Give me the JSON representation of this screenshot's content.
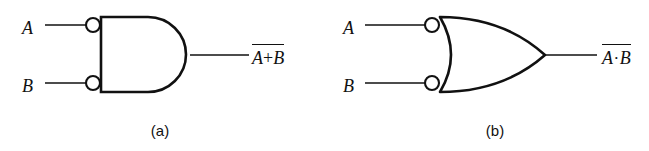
{
  "figure": {
    "type": "logic-gate-diagram",
    "background_color": "#ffffff",
    "stroke_color": "#111111",
    "width": 649,
    "height": 151
  },
  "gates": [
    {
      "id": "gate-a",
      "caption": "(a)",
      "gate_type": "AND",
      "inverted_inputs": true,
      "bubble_count": 2,
      "inputs": [
        {
          "label": "A"
        },
        {
          "label": "B"
        }
      ],
      "output": {
        "expression_parts": {
          "left": "A",
          "operator": "+",
          "right": "B"
        },
        "overbar": true,
        "plain_text": "A+B (complemented)"
      }
    },
    {
      "id": "gate-b",
      "caption": "(b)",
      "gate_type": "OR",
      "inverted_inputs": true,
      "bubble_count": 2,
      "inputs": [
        {
          "label": "A"
        },
        {
          "label": "B"
        }
      ],
      "output": {
        "expression_parts": {
          "left": "A",
          "operator": "·",
          "right": "B"
        },
        "overbar": true,
        "plain_text": "A·B (complemented)"
      }
    }
  ]
}
